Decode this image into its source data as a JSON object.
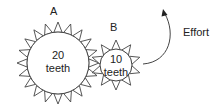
{
  "diagram": {
    "gear_a": {
      "label": "A",
      "teeth_count": "20",
      "teeth_word": "teeth",
      "cx": 58,
      "cy": 63,
      "r": 31,
      "tip_r": 41,
      "n": 20
    },
    "gear_b": {
      "label": "B",
      "teeth_count": "10",
      "teeth_word": "teeth",
      "cx": 116,
      "cy": 65,
      "r": 16,
      "tip_r": 25,
      "n": 10
    },
    "effort_label": "Effort",
    "stroke_color": "#444444"
  }
}
